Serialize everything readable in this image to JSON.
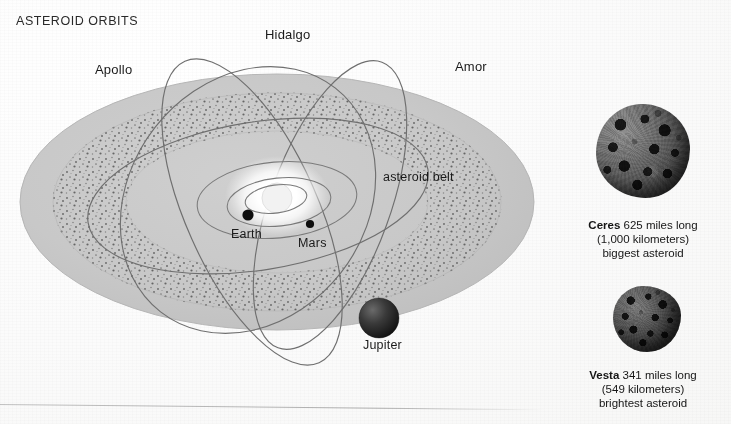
{
  "title": "ASTEROID ORBITS",
  "diagram": {
    "orbit_labels": [
      {
        "name": "apollo-orbit-label",
        "text": "Apollo"
      },
      {
        "name": "hidalgo-orbit-label",
        "text": "Hidalgo"
      },
      {
        "name": "amor-orbit-label",
        "text": "Amor"
      }
    ],
    "feature_labels": [
      {
        "name": "asteroid-belt-label",
        "text": "asteroid belt"
      },
      {
        "name": "earth-label",
        "text": "Earth"
      },
      {
        "name": "mars-label",
        "text": "Mars"
      },
      {
        "name": "jupiter-label",
        "text": "Jupiter"
      }
    ],
    "colors": {
      "disk_fill": "#c9c9c9",
      "belt_speckle": "#7a7a7a",
      "orbit_line": "#6e6e6e",
      "planet_dot": "#111111",
      "sun_glow": "#ffffff",
      "background": "#fdfdfd"
    }
  },
  "asteroid_photos": [
    {
      "name": "ceres",
      "caption_name": "Ceres",
      "caption_size": "625 miles long",
      "caption_metric": "(1,000 kilometers)",
      "caption_note": "biggest asteroid"
    },
    {
      "name": "vesta",
      "caption_name": "Vesta",
      "caption_size": "341 miles long",
      "caption_metric": "(549 kilometers)",
      "caption_note": "brightest asteroid"
    }
  ]
}
